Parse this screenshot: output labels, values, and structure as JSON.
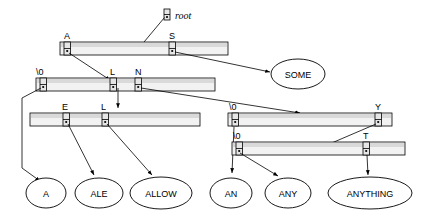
{
  "diagram": {
    "root": {
      "label": "root",
      "x": 167,
      "y": 14
    },
    "colors": {
      "bar_fill": "#f2f2f2",
      "bar_shade": "#d9d9d9",
      "cell_fill": "#e6e6e6",
      "stroke": "#000000",
      "background": "#ffffff"
    },
    "rows": [
      {
        "id": "row-1",
        "x": 60,
        "y": 42,
        "w": 168,
        "h": 13,
        "cells": [
          {
            "label": "A",
            "cx": 67
          },
          {
            "label": "S",
            "cx": 172
          }
        ]
      },
      {
        "id": "row-2",
        "x": 36,
        "y": 78,
        "w": 179,
        "h": 13,
        "cells": [
          {
            "label": "\\0",
            "cx": 43
          },
          {
            "label": "L",
            "cx": 113
          },
          {
            "label": "N",
            "cx": 138
          }
        ]
      },
      {
        "id": "row-3",
        "x": 30,
        "y": 113,
        "w": 170,
        "h": 13,
        "cells": [
          {
            "label": "E",
            "cx": 66
          },
          {
            "label": "L",
            "cx": 105
          }
        ]
      },
      {
        "id": "row-4",
        "x": 228,
        "y": 113,
        "w": 164,
        "h": 13,
        "cells": [
          {
            "label": "\\0",
            "cx": 235
          },
          {
            "label": "Y",
            "cx": 378
          }
        ]
      },
      {
        "id": "row-5",
        "x": 232,
        "y": 142,
        "w": 173,
        "h": 13,
        "cells": [
          {
            "label": "\\0",
            "cx": 239
          },
          {
            "label": "T",
            "cx": 366
          }
        ]
      }
    ],
    "terminals": [
      {
        "label": "A",
        "cx": 46,
        "cy": 193,
        "rx": 20,
        "ry": 15
      },
      {
        "label": "ALE",
        "cx": 99,
        "cy": 193,
        "rx": 24,
        "ry": 15
      },
      {
        "label": "ALLOW",
        "cx": 161,
        "cy": 193,
        "rx": 31,
        "ry": 16
      },
      {
        "label": "AN",
        "cx": 231,
        "cy": 193,
        "rx": 21,
        "ry": 15
      },
      {
        "label": "ANY",
        "cx": 288,
        "cy": 193,
        "rx": 23,
        "ry": 15
      },
      {
        "label": "ANYTHING",
        "cx": 370,
        "cy": 193,
        "rx": 42,
        "ry": 16
      }
    ],
    "edges": [
      {
        "from": "root",
        "to": "row-1",
        "kind": "arrow"
      },
      {
        "from": "cell-A",
        "to": "row-2",
        "kind": "arrow"
      },
      {
        "from": "cell-S",
        "to": "SOME",
        "kind": "arrow"
      },
      {
        "from": "cell-\\0-row2",
        "to": "A",
        "kind": "elbow-arrow"
      },
      {
        "from": "cell-L-row2",
        "to": "row-3",
        "kind": "arrow-down"
      },
      {
        "from": "cell-N-row2",
        "to": "row-4",
        "kind": "arrow"
      },
      {
        "from": "cell-E-row3",
        "to": "ALE",
        "kind": "arrow"
      },
      {
        "from": "cell-L-row3",
        "to": "ALLOW",
        "kind": "arrow"
      },
      {
        "from": "cell-\\0-row4",
        "to": "AN",
        "kind": "arrow-down"
      },
      {
        "from": "cell-Y-row4",
        "to": "row-5",
        "kind": "arrow"
      },
      {
        "from": "cell-\\0-row5",
        "to": "ANY",
        "kind": "arrow"
      },
      {
        "from": "cell-T-row5",
        "to": "ANYTHING",
        "kind": "arrow-down"
      }
    ],
    "some_node": {
      "label": "SOME",
      "cx": 298,
      "cy": 74,
      "rx": 27,
      "ry": 15
    }
  }
}
